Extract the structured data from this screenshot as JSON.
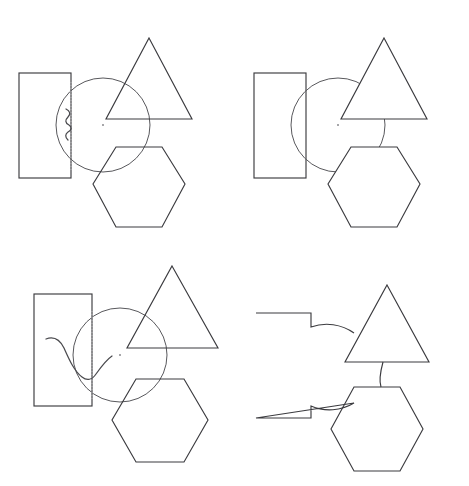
{
  "figure": {
    "layout": "2x2 grid of panels",
    "background_color": "#ffffff",
    "line_color": "#3b3b3f",
    "dotted_guide_color": "#b9b9bd",
    "panels": [
      {
        "id": "top-left",
        "position": "top-left",
        "label": "Panel A",
        "description": "Rectangle, circle with dotted vertical guide and small wavy mark, triangle and hexagon all drawn with full outlines overlapping transparently",
        "shapes": [
          "rectangle",
          "circle",
          "triangle",
          "hexagon",
          "dotted-guide-line",
          "small-squiggle",
          "center-dot"
        ],
        "circle": {
          "cx": 103,
          "cy": 125,
          "r": 47
        },
        "rectangle": {
          "x": 19,
          "y": 73,
          "width": 52,
          "height": 105
        },
        "triangle": {
          "apex_x": 149,
          "apex_y": 38,
          "base_y": 119,
          "base_left_x": 106,
          "base_right_x": 192
        },
        "hexagon": {
          "cx": 139,
          "cy": 184,
          "rx": 46,
          "ry": 43
        },
        "guide_line_x": 71,
        "squiggle": "small vertical wavy stroke inside left of circle"
      },
      {
        "id": "top-right",
        "position": "top-right",
        "label": "Panel B",
        "description": "Same arrangement but the circle outline is occluded where the triangle and hexagon cover it; no dotted guide and no squiggle",
        "shapes": [
          "rectangle",
          "circle-occluded",
          "triangle",
          "hexagon",
          "center-dot"
        ],
        "circle": {
          "cx": 103,
          "cy": 125,
          "r": 47
        },
        "rectangle": {
          "x": 19,
          "y": 73,
          "width": 52,
          "height": 105
        },
        "triangle": {
          "apex_x": 149,
          "apex_y": 38,
          "base_y": 119,
          "base_left_x": 106,
          "base_right_x": 192
        },
        "hexagon": {
          "cx": 139,
          "cy": 184,
          "rx": 46,
          "ry": 43
        },
        "occlusion": "circle hidden behind triangle and hexagon interiors"
      },
      {
        "id": "bottom-left",
        "position": "bottom-left",
        "label": "Panel C",
        "description": "Shifted arrangement with larger curved squiggle crossing the circle and rectangle, dotted vertical guide present",
        "shapes": [
          "rectangle",
          "circle",
          "triangle",
          "hexagon",
          "dotted-guide-line",
          "large-squiggle",
          "center-dot"
        ],
        "circle": {
          "cx": 120,
          "cy": 112,
          "r": 47
        },
        "rectangle": {
          "x": 34,
          "y": 51,
          "width": 58,
          "height": 112
        },
        "triangle": {
          "apex_x": 172,
          "apex_y": 23,
          "base_y": 105,
          "base_left_x": 127,
          "base_right_x": 218
        },
        "hexagon": {
          "cx": 160,
          "cy": 177,
          "rx": 48,
          "ry": 45
        },
        "guide_line_x": 92,
        "squiggle": "large curved V-shaped stroke spanning left of circle"
      },
      {
        "id": "bottom-right",
        "position": "bottom-right",
        "label": "Panel D",
        "description": "Silhouette / union outline: rectangle shows two arc notches where the circle crossed it, circle otherwise hidden, triangle and hexagon joined by a short vertical segment",
        "shapes": [
          "rectangle-notched",
          "triangle",
          "hexagon",
          "connector-segment"
        ],
        "rectangle": {
          "x": 21,
          "y": 70,
          "width": 55,
          "height": 105
        },
        "triangle": {
          "apex_x": 152,
          "apex_y": 42,
          "base_y": 119,
          "base_left_x": 110,
          "base_right_x": 194
        },
        "hexagon": {
          "cx": 142,
          "cy": 186,
          "rx": 46,
          "ry": 42
        },
        "notches": "two concave arcs cut into the rectangle right edge"
      }
    ]
  }
}
